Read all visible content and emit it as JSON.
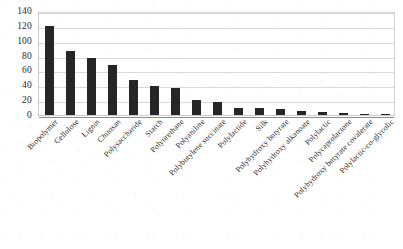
{
  "chart_data": {
    "type": "bar",
    "title": "",
    "subtitle": "",
    "xlabel": "",
    "ylabel": "",
    "ylim": [
      0,
      140
    ],
    "ytick_step": 20,
    "yticks": [
      0,
      20,
      40,
      60,
      80,
      100,
      120,
      140
    ],
    "ytick_labels": [
      "0",
      "20",
      "40",
      "60",
      "80",
      "100",
      "120",
      "140"
    ],
    "grid": true,
    "grid_axis": "y",
    "legend": false,
    "legend_position": "none",
    "bar_color": "#262626",
    "gridline_color": "#d9d9d9",
    "axis_color": "#8d8d8d",
    "label_rotation_degrees": -45,
    "categories": [
      "Biopolymer",
      "Cellulose",
      "Lignin",
      "Chitosan",
      "Polysaccharide",
      "Starch",
      "Polyurethane",
      "Polyaniline",
      "Polybutylene succinate",
      "Polylactide",
      "Silk",
      "Polyhydroxy butyrate",
      "Polyhydroxy alkanoate",
      "Polylactic",
      "Polycaprolactone",
      "Polyhydroxy butyrate covalerate",
      "Polylactic-co-glycolic"
    ],
    "values": [
      120,
      86,
      77,
      67,
      47,
      39,
      37,
      20,
      17,
      10,
      9,
      8,
      6,
      4,
      3,
      2,
      1
    ]
  }
}
